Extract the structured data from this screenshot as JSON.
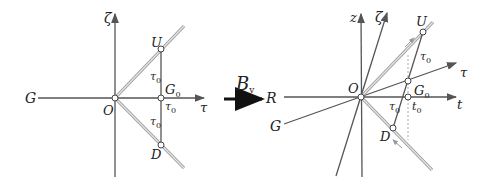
{
  "figure": {
    "transform_label": "B",
    "transform_subscript": "v",
    "left_diagram": {
      "axes": {
        "horizontal_left": "G",
        "horizontal_right": "τ",
        "vertical": "ζ"
      },
      "points": {
        "origin": "O",
        "upper": "U",
        "lower": "D",
        "middle": "G",
        "middle_sub": "0"
      },
      "segment_labels": {
        "upper": "τ",
        "upper_sub": "0",
        "right": "τ",
        "right_sub": "0",
        "lower": "τ",
        "lower_sub": "0"
      }
    },
    "right_diagram": {
      "axes": {
        "horizontal_left": "R",
        "horizontal_right": "t",
        "vertical": "z",
        "tilted_vertical": "ζ",
        "tilted_horizontal": "τ",
        "tilted_left": "G"
      },
      "points": {
        "origin": "O",
        "upper": "U",
        "lower": "D",
        "middle": "G",
        "middle_sub": "0"
      },
      "segment_labels": {
        "upper": "τ",
        "upper_sub": "0",
        "lower": "τ",
        "lower_sub": "0",
        "t_axis": "t",
        "t_axis_sub": "0"
      }
    },
    "colors": {
      "axis": "#555555",
      "light_line": "#bbbbbb",
      "dashed": "#aaaaaa",
      "arrow": "#111111"
    }
  }
}
